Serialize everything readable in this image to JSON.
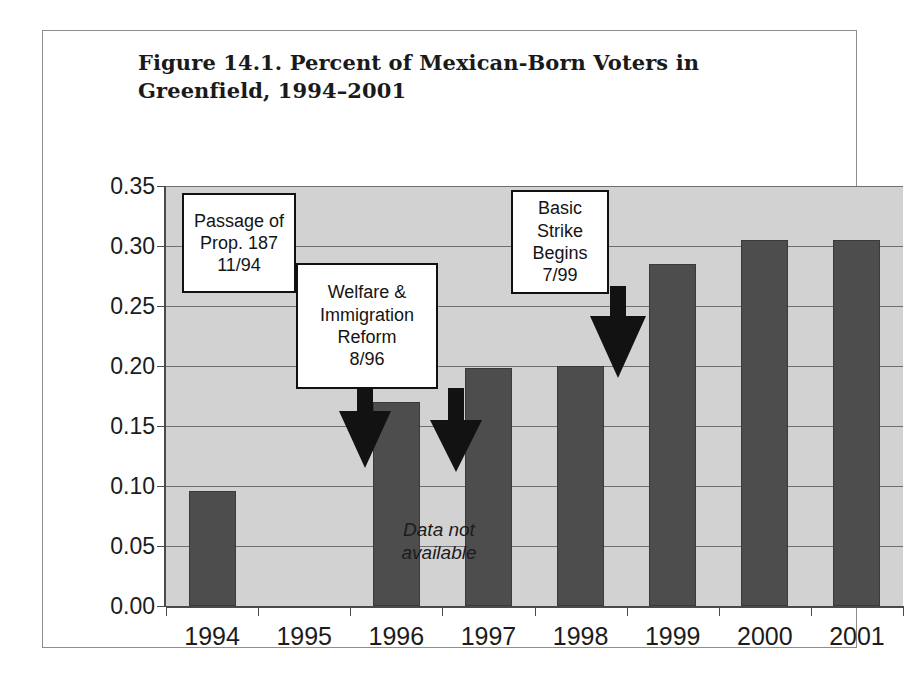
{
  "figure": {
    "title_line1": "Figure 14.1. Percent of Mexican-Born Voters in",
    "title_line2": "Greenfield, 1994–2001",
    "no_data_note_line1": "Data not",
    "no_data_note_line2": "available"
  },
  "colors": {
    "bar": "#4d4d4d",
    "plot_background": "#d2d2d2",
    "gridline": "#6f6f6f",
    "axis": "#4a4a4a",
    "frame": "#8e8e8e",
    "callout_border": "#111111",
    "callout_fill": "#ffffff",
    "text": "#1c1c1c"
  },
  "chart_data": {
    "type": "bar",
    "title": "Figure 14.1. Percent of Mexican-Born Voters in Greenfield, 1994–2001",
    "xlabel": "",
    "ylabel": "",
    "categories": [
      "1994",
      "1995",
      "1996",
      "1997",
      "1998",
      "1999",
      "2000",
      "2001"
    ],
    "values": [
      0.096,
      null,
      0.17,
      0.198,
      0.2,
      0.285,
      0.305,
      0.305
    ],
    "ylim": [
      0.0,
      0.35
    ],
    "ytick_labels": [
      "0.00",
      "0.05",
      "0.10",
      "0.15",
      "0.20",
      "0.25",
      "0.30",
      "0.35"
    ],
    "ytick_values": [
      0.0,
      0.05,
      0.1,
      0.15,
      0.2,
      0.25,
      0.3,
      0.35
    ],
    "grid": true,
    "legend": "none",
    "missing_data_categories": [
      "1995"
    ],
    "annotations": [
      {
        "id": "prop-187",
        "lines": [
          "Passage of",
          "Prop. 187",
          "11/94"
        ],
        "points_to_category": "1994",
        "arrow_direction": "down"
      },
      {
        "id": "welfare-immigration-reform",
        "lines": [
          "Welfare &",
          "Immigration",
          "Reform",
          "8/96"
        ],
        "points_to_category": "1995",
        "arrow_direction": "down"
      },
      {
        "id": "basic-strike",
        "lines": [
          "Basic",
          "Strike",
          "Begins",
          "7/99"
        ],
        "points_to_category": "1999",
        "arrow_direction": "down"
      }
    ]
  }
}
